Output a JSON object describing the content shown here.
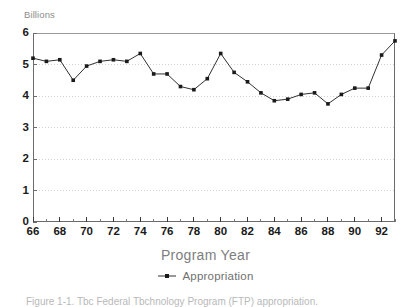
{
  "figure": {
    "units_label": "Billions",
    "xaxis_title": "Program Year",
    "caption": "Figure 1-1.  Tbc  Federal Tbchnology  Program  (FTP)  appropriation."
  },
  "legend": {
    "entries": [
      {
        "label": "Appropriation",
        "color": "#1a1a1a",
        "marker": "square"
      }
    ]
  },
  "chart_data": {
    "type": "line",
    "title": "",
    "subtitle": "",
    "xlabel": "Program Year",
    "ylabel": "Billions",
    "xlim": [
      66,
      93
    ],
    "ylim": [
      0,
      6
    ],
    "ytick_values": [
      0,
      1,
      2,
      3,
      4,
      5,
      6
    ],
    "ytick_labels": [
      "0",
      "1",
      "2",
      "3",
      "4",
      "5",
      "6"
    ],
    "xtick_values": [
      66,
      68,
      70,
      72,
      74,
      76,
      78,
      80,
      82,
      84,
      86,
      88,
      90,
      92
    ],
    "xtick_labels": [
      "66",
      "68",
      "70",
      "72",
      "74",
      "76",
      "78",
      "80",
      "82",
      "84",
      "86",
      "88",
      "90",
      "92"
    ],
    "xtick_minor_values": [
      67,
      69,
      71,
      73,
      75,
      77,
      79,
      81,
      83,
      85,
      87,
      89,
      91,
      93
    ],
    "grid": "horizontal-dotted",
    "legend_position": "bottom-center",
    "x": [
      66,
      67,
      68,
      69,
      70,
      71,
      72,
      73,
      74,
      75,
      76,
      77,
      78,
      79,
      80,
      81,
      82,
      83,
      84,
      85,
      86,
      87,
      88,
      89,
      90,
      91,
      92,
      93
    ],
    "series": [
      {
        "name": "Appropriation",
        "color": "#1a1a1a",
        "marker": "square",
        "values": [
          5.2,
          5.1,
          5.15,
          4.5,
          4.95,
          5.1,
          5.15,
          5.1,
          5.35,
          4.7,
          4.7,
          4.3,
          4.2,
          4.55,
          5.35,
          4.75,
          4.45,
          4.1,
          3.85,
          3.9,
          4.05,
          4.1,
          3.75,
          4.05,
          4.25,
          4.25,
          5.3,
          5.75
        ]
      }
    ]
  }
}
